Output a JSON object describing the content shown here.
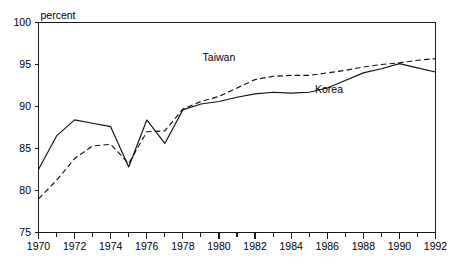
{
  "chart_data": {
    "type": "line",
    "title": "",
    "xlabel": "",
    "ylabel": "percent",
    "unit_label": "percent",
    "xlim": [
      1970,
      1992
    ],
    "ylim": [
      75,
      100
    ],
    "grid": false,
    "legend_position": "inline-annotations",
    "y_ticks": [
      75,
      80,
      85,
      90,
      95,
      100
    ],
    "y_tick_labels": [
      "75",
      "80",
      "85",
      "90",
      "95",
      "100"
    ],
    "x_ticks": [
      1970,
      1971,
      1972,
      1973,
      1974,
      1975,
      1976,
      1977,
      1978,
      1979,
      1980,
      1981,
      1982,
      1983,
      1984,
      1985,
      1986,
      1987,
      1988,
      1989,
      1990,
      1991,
      1992
    ],
    "x_tick_labels_shown": [
      "1970",
      "1972",
      "1974",
      "1976",
      "1978",
      "1980",
      "1982",
      "1984",
      "1986",
      "1988",
      "1990",
      "1992"
    ],
    "x_tick_label_interval": 2,
    "x": [
      1970,
      1971,
      1972,
      1973,
      1974,
      1975,
      1976,
      1977,
      1978,
      1979,
      1980,
      1981,
      1982,
      1983,
      1984,
      1985,
      1986,
      1987,
      1988,
      1989,
      1990,
      1991,
      1992
    ],
    "series": [
      {
        "name": "Korea",
        "style": "solid",
        "color": "#111111",
        "label_x": 1986.1,
        "label_y": 91.6,
        "values": [
          82.5,
          86.5,
          88.4,
          88.0,
          87.6,
          82.8,
          88.4,
          85.6,
          89.6,
          90.3,
          90.6,
          91.1,
          91.5,
          91.7,
          91.6,
          91.7,
          92.2,
          93.1,
          94.0,
          94.5,
          95.1,
          94.6,
          94.1
        ]
      },
      {
        "name": "Taiwan",
        "style": "dashed",
        "color": "#111111",
        "label_x": 1980.0,
        "label_y": 95.4,
        "values": [
          79.0,
          81.2,
          83.8,
          85.3,
          85.5,
          83.2,
          87.0,
          87.1,
          89.7,
          90.6,
          91.2,
          92.2,
          93.2,
          93.6,
          93.7,
          93.7,
          94.0,
          94.3,
          94.7,
          95.0,
          95.2,
          95.5,
          95.7
        ]
      }
    ]
  }
}
